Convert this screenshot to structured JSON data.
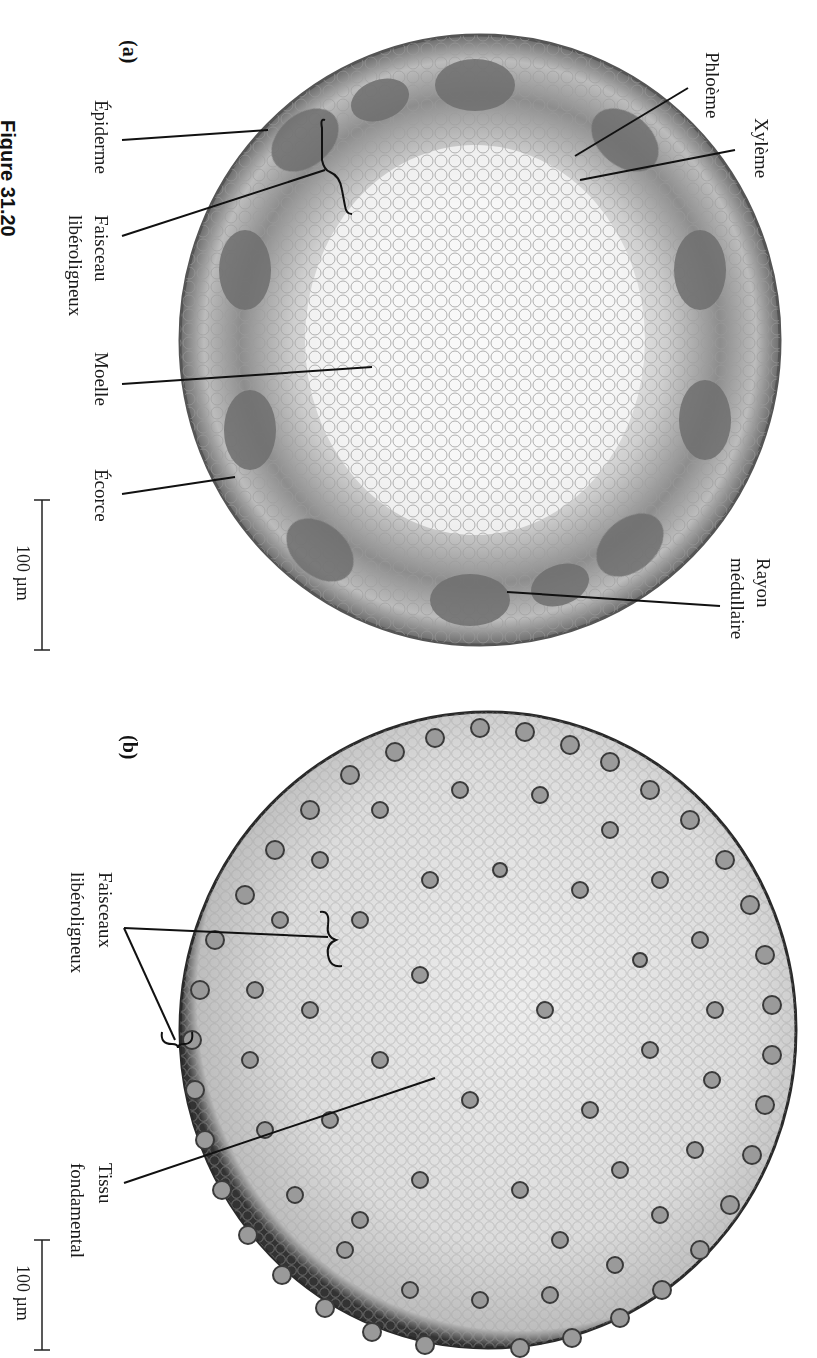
{
  "figure": {
    "caption": "Figure 31.20",
    "orientation": "rotated 90° clockwise"
  },
  "panel_a": {
    "letter": "(a)",
    "labels": {
      "epiderme": "Épiderme",
      "faisceau_1": "Faisceau",
      "faisceau_2": "libéroligneux",
      "moelle": "Moelle",
      "ecorce": "Écorce",
      "phloeme": "Phloème",
      "xyleme": "Xylème",
      "rayon_1": "Rayon",
      "rayon_2": "médullaire"
    },
    "scale_bar": "100 µm"
  },
  "panel_b": {
    "letter": "(b)",
    "labels": {
      "faisceaux_1": "Faisceaux",
      "faisceaux_2": "libéroligneux",
      "tissu_1": "Tissu",
      "tissu_2": "fondamental"
    },
    "scale_bar": "100 µm"
  }
}
